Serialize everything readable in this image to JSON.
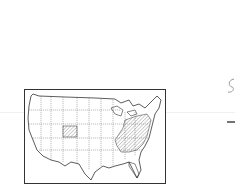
{
  "figure": {
    "title": "",
    "description": "Outline map of the contiguous United States with selected states hatched",
    "hatched_regions": [
      "Colorado",
      "Ohio",
      "Pennsylvania",
      "West Virginia",
      "Virginia",
      "Kentucky",
      "Tennessee",
      "North Carolina",
      "South Carolina",
      "Georgia",
      "Alabama",
      "Maryland",
      "New Jersey",
      "New York"
    ]
  },
  "colors": {
    "line": "#333333",
    "hatch": "#888888",
    "background": "#ffffff"
  },
  "margin_marks": {
    "description": "partial handwritten marks at right edge"
  }
}
